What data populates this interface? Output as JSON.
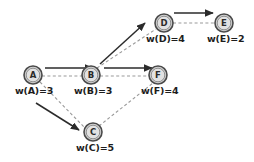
{
  "diagram": {
    "background_color": "#ffffff",
    "node_fill_color": "#d4d4d4",
    "node_stroke_color": "#4a4a4a",
    "dashed_edge_color": "#9a9a9a",
    "solid_arrow_color": "#2b2b2b",
    "nodes": [
      {
        "id": "A",
        "letter": "A",
        "cx": 33,
        "cy": 75,
        "r": 9,
        "weight_label": "w(A)=3",
        "label_x": 15,
        "label_y": 85
      },
      {
        "id": "B",
        "letter": "B",
        "cx": 91,
        "cy": 75,
        "r": 9,
        "weight_label": "w(B)=3",
        "label_x": 74,
        "label_y": 85
      },
      {
        "id": "C",
        "letter": "C",
        "cx": 93,
        "cy": 132,
        "r": 9,
        "weight_label": "w(C)=5",
        "label_x": 76,
        "label_y": 142
      },
      {
        "id": "D",
        "letter": "D",
        "cx": 164,
        "cy": 23,
        "r": 9,
        "weight_label": "w(D)=4",
        "label_x": 146,
        "label_y": 33
      },
      {
        "id": "E",
        "letter": "E",
        "cx": 224,
        "cy": 23,
        "r": 9,
        "weight_label": "w(E)=2",
        "label_x": 207,
        "label_y": 33
      },
      {
        "id": "F",
        "letter": "F",
        "cx": 158,
        "cy": 75,
        "r": 9,
        "weight_label": "w(F)=4",
        "label_x": 141,
        "label_y": 85
      }
    ],
    "dashed_edges": [
      {
        "from": "A",
        "to": "B",
        "d": "M 42 76 L 82 76"
      },
      {
        "from": "A",
        "to": "C",
        "d": "M 40 82 L 85 128"
      },
      {
        "from": "B",
        "to": "D",
        "d": "M 97 68 L 156 29"
      },
      {
        "from": "B",
        "to": "F",
        "d": "M 100 76 L 149 76"
      },
      {
        "from": "C",
        "to": "F",
        "d": "M 99 126 L 153 83"
      },
      {
        "from": "D",
        "to": "E",
        "d": "M 173 23 L 215 23"
      }
    ],
    "solid_arrows": [
      {
        "from": "A",
        "to": "B",
        "d": "M 45 68 L 93 68"
      },
      {
        "from": "A",
        "to": "C",
        "d": "M 36 103 L 79 130"
      },
      {
        "from": "B",
        "to": "D",
        "d": "M 100 64 L 145 23"
      },
      {
        "from": "B",
        "to": "F",
        "d": "M 104 68 L 152 68"
      },
      {
        "from": "D",
        "to": "E",
        "d": "M 174 13 L 213 13"
      }
    ]
  }
}
